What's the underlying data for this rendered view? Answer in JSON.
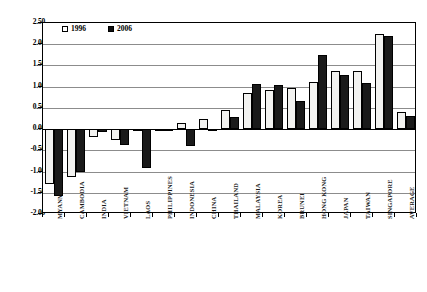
{
  "chart_data": {
    "type": "bar",
    "title": "",
    "xlabel": "",
    "ylabel": "",
    "ylim": [
      -2.0,
      2.5
    ],
    "ytick_labels": [
      "2.50",
      "2.00",
      "1.50",
      "1.00",
      "0.50",
      "0.00",
      "-0.50",
      "-1.00",
      "-1.50",
      "-2.00"
    ],
    "ytick_values": [
      2.5,
      2.0,
      1.5,
      1.0,
      0.5,
      0.0,
      -0.5,
      -1.0,
      -1.5,
      -2.0
    ],
    "grid": true,
    "legend_position": "top-left",
    "categories": [
      "MYANMAR",
      "CAMBODIA",
      "INDIA",
      "VIETNAM",
      "LAOS",
      "PHILIPPINES",
      "INDONESIA",
      "CHINA",
      "THAILAND",
      "MALAYSIA",
      "KOREA",
      "BRUNEI",
      "HONG KONG",
      "JAPAN",
      "TAIWAN",
      "SINGAPORE",
      "AVERAGE"
    ],
    "series": [
      {
        "name": "1996",
        "color": "#f2f2f0",
        "values": [
          -1.3,
          -1.13,
          -0.18,
          -0.26,
          -0.05,
          -0.02,
          0.15,
          0.24,
          0.45,
          0.85,
          0.92,
          0.98,
          1.12,
          1.37,
          1.38,
          2.25,
          0.4
        ]
      },
      {
        "name": "2006",
        "color": "#1a1a1a",
        "values": [
          -1.58,
          -1.02,
          -0.07,
          -0.38,
          -0.92,
          -0.02,
          -0.4,
          -0.01,
          0.28,
          1.06,
          1.03,
          0.66,
          1.75,
          1.28,
          1.08,
          2.2,
          0.3
        ]
      }
    ]
  },
  "legend": {
    "items": [
      {
        "label": "1996",
        "style": "open"
      },
      {
        "label": "2006",
        "style": "filled"
      }
    ]
  }
}
